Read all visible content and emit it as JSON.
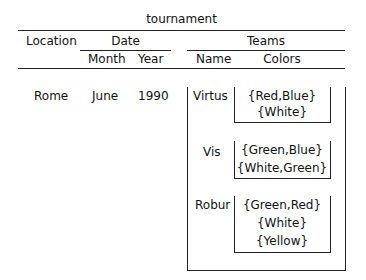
{
  "title": "tournament",
  "headers": {
    "location": "Location",
    "date": "Date",
    "month": "Month",
    "year": "Year",
    "teams": "Teams",
    "name": "Name",
    "colors": "Colors"
  },
  "row": {
    "location": "Rome",
    "month": "June",
    "year": "1990",
    "teams": [
      {
        "name": "Virtus",
        "colors": [
          "{Red,Blue}",
          "{White}"
        ]
      },
      {
        "name": "Vis",
        "colors": [
          "{Green,Blue}",
          "{White,Green}"
        ]
      },
      {
        "name": "Robur",
        "colors": [
          "{Green,Red}",
          "{White}",
          "{Yellow}"
        ]
      }
    ]
  }
}
